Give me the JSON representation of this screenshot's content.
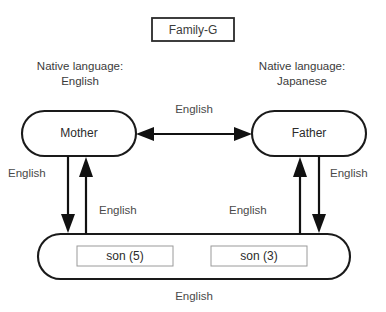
{
  "diagram": {
    "title_box": {
      "label": "Family-G"
    },
    "annotations": [
      {
        "name": "mother-native-language",
        "line1": "Native language:",
        "line2": "English"
      },
      {
        "name": "father-native-language",
        "line1": "Native language:",
        "line2": "Japanese"
      }
    ],
    "nodes": [
      {
        "id": "mother",
        "label": "Mother"
      },
      {
        "id": "father",
        "label": "Father"
      },
      {
        "id": "children",
        "label": ""
      }
    ],
    "children": [
      {
        "id": "son-5",
        "label": "son (5)"
      },
      {
        "id": "son-3",
        "label": "son (3)"
      }
    ],
    "edges": [
      {
        "id": "mother-father",
        "label": "English",
        "direction": "bidirectional"
      },
      {
        "id": "mother-to-children",
        "label": "English",
        "direction": "down"
      },
      {
        "id": "children-to-mother",
        "label": "English",
        "direction": "up"
      },
      {
        "id": "children-to-father",
        "label": "English",
        "direction": "up"
      },
      {
        "id": "father-to-children",
        "label": "English",
        "direction": "down"
      }
    ],
    "caption": {
      "label": "English"
    },
    "colors": {
      "background": "#ffffff",
      "node_stroke": "#1a1a1a",
      "edge_stroke": "#111111",
      "child_box_stroke": "#9a9a9a",
      "text": "#3b3b3b"
    }
  }
}
